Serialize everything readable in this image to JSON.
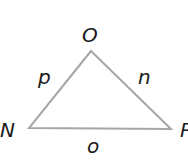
{
  "diagram": {
    "type": "triangle",
    "vertices": [
      {
        "label": "O",
        "x": 91,
        "y": 51
      },
      {
        "label": "N",
        "x": 29,
        "y": 128
      },
      {
        "label": "P",
        "x": 171,
        "y": 129
      }
    ],
    "sides": [
      {
        "label": "p",
        "between": [
          "N",
          "O"
        ]
      },
      {
        "label": "n",
        "between": [
          "O",
          "P"
        ]
      },
      {
        "label": "o",
        "between": [
          "N",
          "P"
        ]
      }
    ],
    "stroke_color": "#a6a6a6",
    "label_color": "#1a1a1a"
  }
}
